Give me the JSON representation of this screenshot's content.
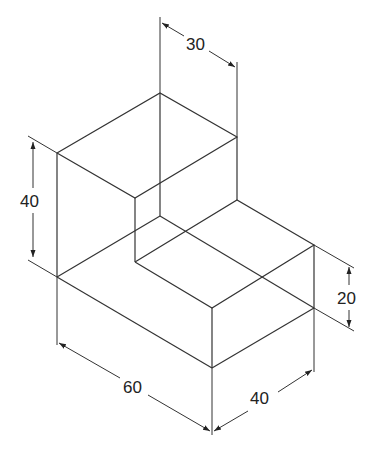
{
  "diagram": {
    "type": "isometric-drawing",
    "line_color": "#333333",
    "dimensions": [
      {
        "id": "top-depth",
        "label": "30"
      },
      {
        "id": "height-total",
        "label": "40"
      },
      {
        "id": "height-step",
        "label": "20"
      },
      {
        "id": "length",
        "label": "60"
      },
      {
        "id": "width",
        "label": "40"
      }
    ]
  }
}
